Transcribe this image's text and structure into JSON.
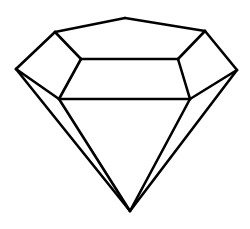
{
  "illustration": {
    "subject": "diamond-gem-outline",
    "stroke_color": "#000000",
    "background_color": "#ffffff",
    "stroke_width": 2.6,
    "vertices": {
      "apex": [
        125,
        18
      ],
      "upper_left": [
        55,
        32
      ],
      "upper_right": [
        205,
        31
      ],
      "far_left": [
        16,
        69
      ],
      "far_right": [
        237,
        70
      ],
      "table_left": [
        81,
        59
      ],
      "table_right": [
        178,
        59
      ],
      "girdle_left": [
        59,
        99
      ],
      "girdle_right": [
        190,
        99
      ],
      "culet": [
        130,
        211
      ]
    }
  }
}
